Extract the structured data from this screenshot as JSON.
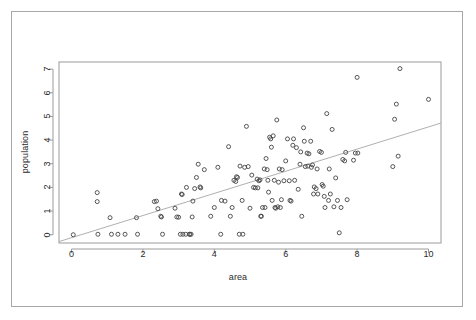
{
  "figure": {
    "background_color": "#ffffff",
    "border_color": "#a8a8a8",
    "axis_color": "#9a9a9a",
    "text_color": "#2b2b2b",
    "point_stroke_color": "#444444",
    "line_color": "#b0b0b0"
  },
  "chart_data": {
    "type": "scatter",
    "title": "",
    "xlabel": "area",
    "ylabel": "population",
    "xlim": [
      -0.35,
      10.35
    ],
    "ylim": [
      -0.35,
      7.3
    ],
    "xticks": [
      0,
      2,
      4,
      6,
      8,
      10
    ],
    "yticks": [
      0,
      1,
      2,
      3,
      4,
      5,
      6,
      7
    ],
    "xticklabels": [
      "0",
      "2",
      "4",
      "6",
      "8",
      "10"
    ],
    "yticklabels": [
      "0",
      "1",
      "2",
      "3",
      "4",
      "5",
      "6",
      "7"
    ],
    "grid": false,
    "legend": null,
    "marker": "open-circle",
    "marker_size": 4,
    "trendline": {
      "type": "linear-fit",
      "x_start": -0.35,
      "y_start": -0.29,
      "x_end": 10.35,
      "y_end": 4.72
    },
    "x": [
      0.05,
      0.72,
      0.72,
      0.74,
      1.08,
      1.12,
      1.3,
      1.5,
      1.82,
      1.85,
      2.32,
      2.38,
      2.42,
      2.5,
      2.52,
      2.55,
      2.9,
      2.95,
      3.0,
      3.05,
      3.08,
      3.1,
      3.12,
      3.2,
      3.22,
      3.3,
      3.32,
      3.35,
      3.38,
      3.4,
      3.45,
      3.5,
      3.55,
      3.6,
      3.62,
      3.72,
      3.9,
      4.0,
      4.1,
      4.18,
      4.2,
      4.3,
      4.4,
      4.45,
      4.5,
      4.55,
      4.6,
      4.62,
      4.65,
      4.7,
      4.72,
      4.78,
      4.8,
      4.85,
      4.9,
      4.95,
      5.0,
      5.05,
      5.1,
      5.15,
      5.2,
      5.22,
      5.25,
      5.28,
      5.3,
      5.32,
      5.35,
      5.4,
      5.42,
      5.45,
      5.48,
      5.5,
      5.52,
      5.55,
      5.58,
      5.6,
      5.62,
      5.65,
      5.68,
      5.7,
      5.72,
      5.75,
      5.78,
      5.8,
      5.82,
      5.85,
      5.88,
      5.9,
      5.95,
      6.0,
      6.05,
      6.1,
      6.12,
      6.15,
      6.2,
      6.22,
      6.25,
      6.3,
      6.35,
      6.4,
      6.42,
      6.45,
      6.5,
      6.52,
      6.55,
      6.6,
      6.62,
      6.65,
      6.7,
      6.72,
      6.75,
      6.78,
      6.8,
      6.85,
      6.88,
      6.9,
      6.95,
      7.0,
      7.02,
      7.05,
      7.08,
      7.1,
      7.15,
      7.2,
      7.22,
      7.25,
      7.3,
      7.35,
      7.4,
      7.45,
      7.5,
      7.55,
      7.6,
      7.65,
      7.68,
      7.72,
      7.9,
      7.95,
      8.0,
      8.02,
      9.0,
      9.05,
      9.1,
      9.15,
      9.2,
      10.0
    ],
    "y": [
      0.0,
      1.78,
      1.4,
      0.02,
      0.72,
      0.02,
      0.02,
      0.02,
      0.72,
      0.02,
      1.4,
      1.42,
      1.1,
      0.78,
      0.75,
      0.02,
      1.12,
      0.75,
      0.74,
      0.02,
      1.72,
      1.7,
      0.02,
      0.02,
      2.0,
      0.02,
      0.02,
      0.02,
      0.75,
      1.42,
      1.95,
      2.42,
      2.98,
      2.02,
      1.98,
      2.75,
      0.78,
      1.15,
      2.85,
      0.02,
      1.45,
      1.42,
      3.72,
      0.78,
      1.15,
      2.3,
      2.25,
      2.45,
      2.42,
      0.02,
      2.9,
      1.45,
      0.02,
      2.85,
      4.58,
      2.88,
      1.12,
      2.52,
      2.0,
      1.98,
      2.35,
      1.98,
      2.28,
      2.32,
      0.78,
      0.78,
      1.15,
      2.78,
      1.15,
      3.22,
      2.75,
      2.3,
      1.8,
      4.12,
      4.05,
      3.7,
      1.45,
      4.18,
      2.3,
      1.15,
      1.12,
      4.85,
      1.18,
      2.22,
      2.78,
      1.15,
      1.48,
      2.75,
      2.28,
      3.12,
      4.05,
      2.28,
      1.45,
      1.42,
      3.78,
      4.05,
      2.3,
      3.68,
      1.92,
      2.98,
      3.5,
      0.78,
      4.52,
      3.95,
      2.88,
      3.45,
      2.9,
      3.42,
      3.95,
      2.85,
      2.95,
      1.72,
      2.02,
      1.95,
      2.78,
      1.72,
      3.52,
      3.48,
      2.12,
      2.05,
      1.62,
      1.15,
      5.12,
      1.45,
      2.78,
      1.72,
      4.45,
      1.18,
      2.4,
      1.45,
      0.08,
      1.15,
      3.18,
      3.12,
      3.48,
      1.48,
      3.15,
      3.45,
      6.65,
      3.45,
      2.88,
      4.88,
      5.52,
      3.32,
      7.02,
      5.72
    ]
  }
}
